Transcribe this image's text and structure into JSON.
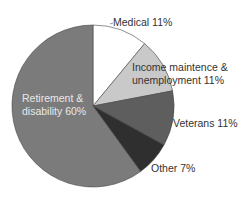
{
  "chart_data": {
    "type": "pie",
    "title": "",
    "start_angle_deg": 0,
    "direction": "clockwise",
    "slices": [
      {
        "label": "Medical",
        "value": 11,
        "display": "Medical 11%",
        "color": "#ffffff"
      },
      {
        "label": "Income maintence & unemployment",
        "value": 11,
        "display": "Income maintence & unemployment 11%",
        "color": "#c9c9c9"
      },
      {
        "label": "Veterans",
        "value": 11,
        "display": "Veterans 11%",
        "color": "#5e5e5e"
      },
      {
        "label": "Other",
        "value": 7,
        "display": "Other 7%",
        "color": "#2f2f2f"
      },
      {
        "label": "Retirement & disability",
        "value": 60,
        "display": "Retirement & disability 60%",
        "color": "#7b7b7b"
      }
    ],
    "legend": "none (labels placed on/near slices)"
  },
  "labels": {
    "medical": "Medical 11%",
    "income_line1": "Income maintence &",
    "income_line2": "unemployment 11%",
    "veterans": "Veterans 11%",
    "other": "Other 7%",
    "retirement_line1": "Retirement &",
    "retirement_line2": "disability 60%"
  }
}
